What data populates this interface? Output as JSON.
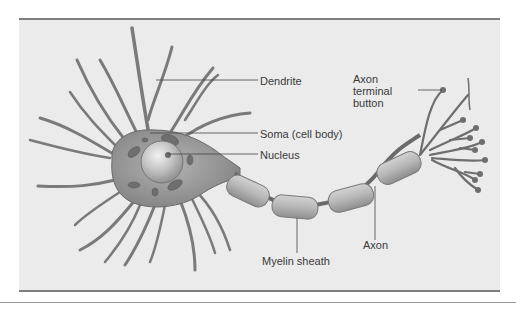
{
  "diagram": {
    "type": "labeled-anatomy-illustration",
    "colors": {
      "panel_background": "#ebebeb",
      "frame_rule": "#7d7d7d",
      "cell_body": "#8e8e8e",
      "myelin": "#b4b4b4",
      "label_text": "#3a3a3a",
      "leader_line": "#444444"
    },
    "labels": {
      "dendrite": "Dendrite",
      "soma": "Soma (cell body)",
      "nucleus": "Nucleus",
      "axon_terminal_button": "Axon\nterminal\nbutton",
      "axon": "Axon",
      "myelin_sheath": "Myelin sheath"
    }
  }
}
